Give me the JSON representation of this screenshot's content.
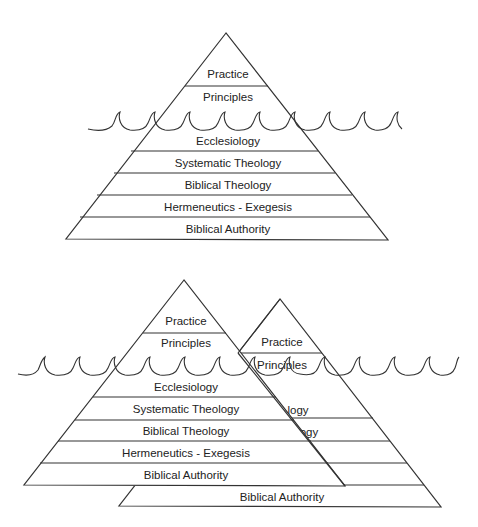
{
  "diagram": {
    "top_pyramid": {
      "above_water": [
        "Practice",
        "Principles"
      ],
      "below_water": [
        "Ecclesiology",
        "Systematic Theology",
        "Biblical Theology",
        "Hermeneutics - Exegesis",
        "Biblical Authority"
      ]
    },
    "bottom_front_pyramid": {
      "above_water": [
        "Practice",
        "Principles"
      ],
      "below_water": [
        "Ecclesiology",
        "Systematic Theology",
        "Biblical Theology",
        "Hermeneutics - Exegesis",
        "Biblical Authority"
      ]
    },
    "bottom_back_pyramid": {
      "above_water": [
        "Practice",
        "Principles"
      ],
      "visible_fragments": [
        "logy",
        "ogy"
      ],
      "base_label": "Biblical Authority"
    },
    "colors": {
      "line": "#333333",
      "text": "#222222",
      "background": "#ffffff"
    }
  }
}
